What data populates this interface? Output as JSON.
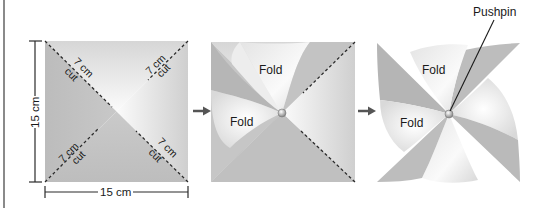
{
  "figure": {
    "steps": [
      {
        "id": "step-1-square",
        "description": "Square with diagonal cut lines",
        "dimensions": {
          "height_label": "15 cm",
          "width_label": "15 cm"
        },
        "cut_labels": [
          {
            "length": "7 cm",
            "action": "cut",
            "corner": "top-left"
          },
          {
            "length": "7 cm",
            "action": "cut",
            "corner": "top-right"
          },
          {
            "length": "7 cm",
            "action": "cut",
            "corner": "bottom-left"
          },
          {
            "length": "7 cm",
            "action": "cut",
            "corner": "bottom-right"
          }
        ]
      },
      {
        "id": "step-2-partial-fold",
        "description": "Two corners folded to center",
        "fold_labels": [
          "Fold",
          "Fold"
        ]
      },
      {
        "id": "step-3-pinwheel",
        "description": "All corners folded and pinned",
        "fold_labels": [
          "Fold",
          "Fold"
        ],
        "callout": "Pushpin"
      }
    ],
    "arrows": [
      "step-arrow",
      "step-arrow"
    ],
    "colors": {
      "paper_dark": "#b9b9b9",
      "paper_mid": "#cfcfcf",
      "paper_light": "#f2f2f2",
      "line": "#2a2a2a",
      "arrow": "#555555",
      "border": "#8a8a8a"
    }
  }
}
